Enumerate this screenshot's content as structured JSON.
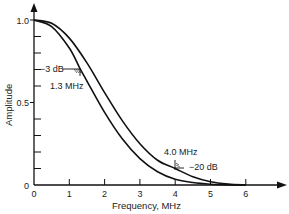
{
  "chart_data": {
    "type": "line",
    "title": "",
    "xlabel": "Frequency, MHz",
    "ylabel": "Amplitude",
    "xlim": [
      0,
      6.5
    ],
    "ylim": [
      0,
      1.05
    ],
    "x_ticks": [
      "0",
      "1",
      "2",
      "3",
      "4",
      "5",
      "6"
    ],
    "y_tick_labels": [
      {
        "value": 0,
        "label": "0"
      },
      {
        "value": 0.5,
        "label": "0.5"
      },
      {
        "value": 1.0,
        "label": "1.0"
      }
    ],
    "y_minor_ticks": [
      0.1,
      0.2,
      0.3,
      0.4,
      0.6,
      0.7,
      0.8,
      0.9
    ],
    "grid": false,
    "legend": null,
    "series": [
      {
        "name": "inner curve",
        "x": [
          0,
          0.5,
          1.0,
          1.3,
          1.5,
          2.0,
          2.5,
          3.0,
          3.5,
          4.0,
          4.5,
          5.0,
          5.5,
          6.0
        ],
        "values": [
          1.0,
          0.96,
          0.83,
          0.707,
          0.63,
          0.44,
          0.28,
          0.16,
          0.08,
          0.035,
          0.015,
          0.005,
          0.001,
          0.0
        ]
      },
      {
        "name": "outer curve",
        "x": [
          0,
          0.5,
          1.0,
          1.5,
          2.0,
          2.5,
          3.0,
          3.5,
          4.0,
          4.5,
          5.0,
          5.5,
          6.0
        ],
        "values": [
          1.0,
          0.98,
          0.89,
          0.74,
          0.56,
          0.39,
          0.25,
          0.15,
          0.1,
          0.05,
          0.02,
          0.006,
          0.0
        ]
      }
    ],
    "annotations": [
      {
        "text": "−3 dB",
        "x": 1.3,
        "y": 0.707
      },
      {
        "text": "1.3 MHz",
        "x": 1.3,
        "y": 0.707
      },
      {
        "text": "4.0 MHz",
        "x": 4.0,
        "y": 0.1
      },
      {
        "text": "−20 dB",
        "x": 4.0,
        "y": 0.1
      }
    ]
  },
  "labels": {
    "xlabel": "Frequency, MHz",
    "ylabel": "Amplitude",
    "ann_3db": "−3 dB",
    "ann_13": "1.3 MHz",
    "ann_40": "4.0 MHz",
    "ann_20db": "−20 dB"
  }
}
